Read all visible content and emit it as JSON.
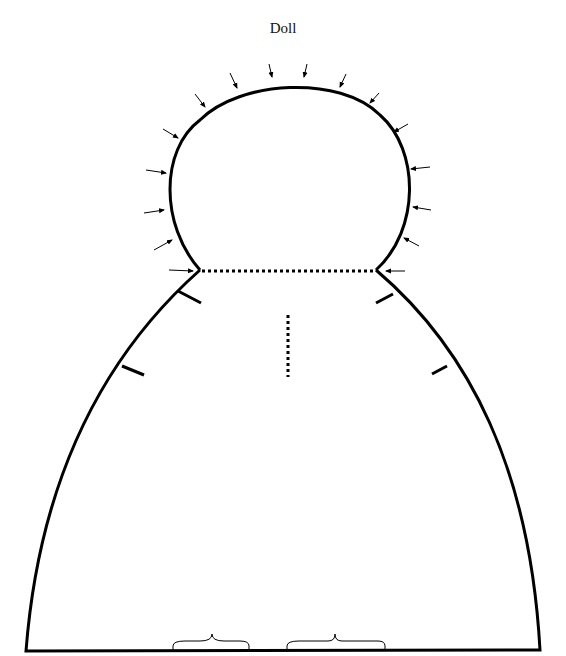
{
  "title": "Doll",
  "colors": {
    "stroke": "#000000",
    "background": "#ffffff"
  },
  "pattern": {
    "head": {
      "shape": "circle-arc",
      "stitch_arrows": 18
    },
    "neck_line": {
      "style": "dotted"
    },
    "center_mark": {
      "style": "dotted-vertical"
    },
    "notches": 4,
    "bottom_braces": 2
  }
}
